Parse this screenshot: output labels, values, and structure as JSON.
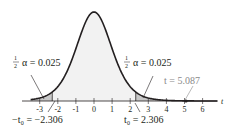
{
  "chart_data": {
    "type": "area",
    "title": "",
    "xlabel": "t",
    "ylabel": "",
    "distribution": "Student t (density curve)",
    "xlim": [
      -3.5,
      6.8
    ],
    "x_ticks": [
      -3,
      -2,
      -1,
      0,
      1,
      2,
      3,
      4,
      5,
      6
    ],
    "x_tick_labels": [
      "-3",
      "-2",
      "-1",
      "0",
      "1",
      "2",
      "3",
      "4",
      "5",
      "6"
    ],
    "critical_values": {
      "lower": -2.306,
      "upper": 2.306
    },
    "shaded_tails": [
      {
        "region": "t < -2.306",
        "area": 0.025
      },
      {
        "region": "t > 2.306",
        "area": 0.025
      }
    ],
    "test_statistic": 5.087,
    "grid": false,
    "legend": null
  },
  "labels": {
    "axis_var": "t",
    "left_tail_frac": "1/2",
    "left_tail_eq": "α = 0.025",
    "right_tail_frac": "1/2",
    "right_tail_eq": "α = 0.025",
    "left_crit": "−t₀ = −2.306",
    "right_crit": "t₀ = 2.306",
    "test_stat": "t = 5.087",
    "ticks": [
      "-3",
      "-2",
      "-1",
      "0",
      "1",
      "2",
      "3",
      "4",
      "5",
      "6"
    ]
  },
  "colors": {
    "curve": "#231f20",
    "body_fill": "#f2f2f2",
    "tail_fill": "#c8c8c8",
    "test_stat": "#8a8a8a"
  }
}
